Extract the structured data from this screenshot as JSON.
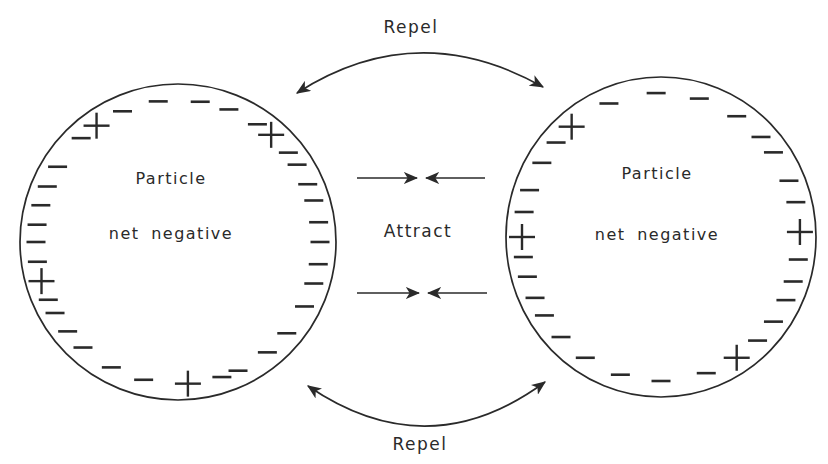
{
  "colors": {
    "background": "#ffffff",
    "ink": "#2a2a2a"
  },
  "labels": {
    "repel_top": "Repel",
    "repel_bottom": "Repel",
    "attract": "Attract"
  },
  "particles": [
    {
      "name": "left",
      "line1": "Particle",
      "line2": "net negative",
      "geometry": {
        "cx": 178,
        "cy": 242,
        "rx": 158,
        "ry": 158,
        "charge_inset": 16,
        "label_dx": -7,
        "label1_dy": -58,
        "label2_dy": -3
      },
      "plus_angles": [
        49,
        125,
        196,
        274
      ],
      "minus_angles": [
        0,
        8,
        17,
        24,
        33,
        39,
        56,
        69,
        81,
        98,
        113,
        133,
        148,
        157,
        165,
        173,
        180,
        188,
        204,
        210,
        219,
        228,
        242,
        256,
        288,
        295,
        309,
        320,
        333,
        343,
        351
      ]
    },
    {
      "name": "right",
      "line1": "Particle",
      "line2": "net negative",
      "geometry": {
        "cx": 661,
        "cy": 237,
        "rx": 155,
        "ry": 160,
        "charge_inset": 16,
        "label_dx": -4,
        "label1_dy": -58,
        "label2_dy": 3
      },
      "plus_angles": [
        2,
        130,
        180,
        303
      ],
      "minus_angles": [
        14,
        23,
        36,
        44,
        57,
        74,
        92,
        112,
        139,
        149,
        161,
        170,
        188,
        196,
        205,
        213,
        224,
        237,
        253,
        270,
        289,
        314,
        324,
        334,
        342,
        351
      ]
    }
  ]
}
